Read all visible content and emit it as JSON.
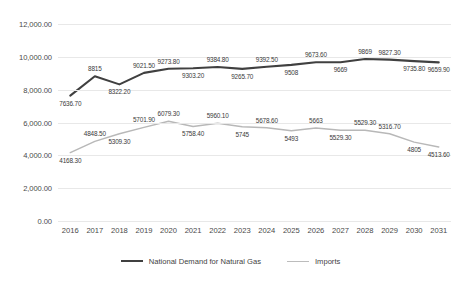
{
  "chart_data": {
    "type": "line",
    "title": "",
    "xlabel": "",
    "ylabel": "",
    "grid": true,
    "legend_position": "bottom",
    "ylim": [
      0,
      12000
    ],
    "ytick_labels": [
      "12,000.00",
      "10,000.00",
      "8,000.00",
      "6,000.00",
      "4,000.00",
      "2,000.00",
      "0.00"
    ],
    "ytick_values": [
      12000,
      10000,
      8000,
      6000,
      4000,
      2000,
      0
    ],
    "categories": [
      "2016",
      "2017",
      "2018",
      "2019",
      "2020",
      "2021",
      "2022",
      "2023",
      "2024",
      "2025",
      "2026",
      "2027",
      "2028",
      "2029",
      "2030",
      "2031"
    ],
    "series": [
      {
        "name": "National Demand for Natural Gas",
        "color": "#404040",
        "values": [
          7636.7,
          8815,
          8322.2,
          9021.5,
          9273.8,
          9303.2,
          9384.8,
          9265.7,
          9392.5,
          9508,
          9673.6,
          9669,
          9869,
          9827.3,
          9735.8,
          9659.9
        ],
        "labels": [
          "7636.70",
          "8815",
          "8322.20",
          "9021.50",
          "9273.80",
          "9303.20",
          "9384.80",
          "9265.70",
          "9392.50",
          "9508",
          "9673.60",
          "9669",
          "9869",
          "9827.30",
          "9735.80",
          "9659.90"
        ],
        "label_side": [
          "below",
          "above",
          "below",
          "above",
          "above",
          "below",
          "above",
          "below",
          "above",
          "below",
          "above",
          "below",
          "above",
          "above",
          "below",
          "below"
        ]
      },
      {
        "name": "Imports",
        "color": "#b8b8b8",
        "values": [
          4168.3,
          4848.5,
          5309.3,
          5701.9,
          6079.3,
          5758.4,
          5960.1,
          5745,
          5678.6,
          5493,
          5663,
          5529.3,
          5529.3,
          5316.7,
          4805,
          4513.6
        ],
        "labels": [
          "4168.30",
          "4848.50",
          "5309.30",
          "5701.90",
          "6079.30",
          "5758.40",
          "5960.10",
          "5745",
          "5678.60",
          "5493",
          "5663",
          "5529.30",
          "5529.30",
          "5316.70",
          "4805",
          "4513.60"
        ],
        "label_side": [
          "below",
          "above",
          "below",
          "above",
          "above",
          "below",
          "above",
          "below",
          "above",
          "below",
          "above",
          "below",
          "above",
          "above",
          "below",
          "below"
        ]
      }
    ]
  },
  "legend": {
    "items": [
      {
        "label": "National Demand for Natural Gas",
        "color": "#404040",
        "width": "2.2px"
      },
      {
        "label": "Imports",
        "color": "#bcbcbc",
        "width": "1.6px"
      }
    ]
  }
}
